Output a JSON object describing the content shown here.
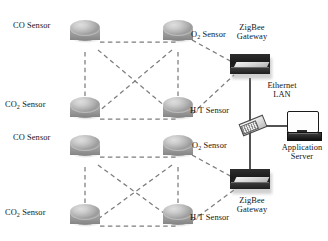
{
  "diagram": {
    "colors": {
      "background": "#ffffff",
      "node_fill": "#bcbcbc",
      "link_dashed": "#7d7d7d",
      "link_solid": "#1a1a1a",
      "gateway_dark": "#1e1e1e",
      "text": "#141414"
    },
    "link_styles": {
      "sensor_mesh": "dashed",
      "sensor_to_gateway": "dashed",
      "ethernet": "solid"
    }
  },
  "sensors": [
    {
      "id": "s1",
      "label": "CO Sensor",
      "label_html": "CO Sensor",
      "sub": "",
      "x": 85,
      "y": 30,
      "label_x": 14,
      "label_y": 25,
      "label_align": "right",
      "cluster": "upper"
    },
    {
      "id": "s2",
      "label": "O2 Sensor",
      "label_html": "O",
      "sub": "2",
      "x": 178,
      "y": 30,
      "label_x": 196,
      "label_y": 33,
      "label_align": "left",
      "cluster": "upper"
    },
    {
      "id": "s3",
      "label": "CO2 Sensor",
      "label_html": "CO",
      "sub": "2",
      "x": 85,
      "y": 107,
      "label_x": 6,
      "label_y": 105,
      "label_align": "right",
      "cluster": "upper"
    },
    {
      "id": "s4",
      "label": "H/T Sensor",
      "label_html": "H/T Sensor",
      "sub": "",
      "x": 178,
      "y": 107,
      "label_x": 194,
      "label_y": 110,
      "label_align": "left",
      "cluster": "upper"
    },
    {
      "id": "s5",
      "label": "CO Sensor",
      "label_html": "CO Sensor",
      "sub": "",
      "x": 85,
      "y": 145,
      "label_x": 14,
      "label_y": 138,
      "label_align": "right",
      "cluster": "lower"
    },
    {
      "id": "s6",
      "label": "O2 Sensor",
      "label_html": "O",
      "sub": "2",
      "x": 178,
      "y": 145,
      "label_x": 196,
      "label_y": 146,
      "label_align": "left",
      "cluster": "lower"
    },
    {
      "id": "s7",
      "label": "CO2 Sensor",
      "label_html": "CO",
      "sub": "2",
      "x": 85,
      "y": 214,
      "label_x": 6,
      "label_y": 212,
      "label_align": "right",
      "cluster": "lower"
    },
    {
      "id": "s8",
      "label": "H/T Sensor",
      "label_html": "H/T Sensor",
      "sub": "",
      "x": 178,
      "y": 214,
      "label_x": 194,
      "label_y": 216,
      "label_align": "left",
      "cluster": "lower"
    }
  ],
  "gateways": [
    {
      "id": "gw-top",
      "label_line1": "ZigBee",
      "label_line2": "Gateway",
      "x": 230,
      "y": 57,
      "label_x": 244,
      "label_y": 25,
      "label_position": "above"
    },
    {
      "id": "gw-bottom",
      "label_line1": "ZigBee",
      "label_line2": "Gateway",
      "x": 230,
      "y": 172,
      "label_x": 244,
      "label_y": 199,
      "label_position": "below"
    }
  ],
  "switch": {
    "id": "ethernet-switch",
    "x": 244,
    "y": 118
  },
  "ethernet": {
    "label_line1": "Ethernet",
    "label_line2": "LAN",
    "label_x": 281,
    "label_y": 84
  },
  "server": {
    "id": "application-server",
    "label_line1": "Application",
    "label_line2": "Server",
    "x": 287,
    "y": 113,
    "label_x": 304,
    "label_y": 146
  }
}
